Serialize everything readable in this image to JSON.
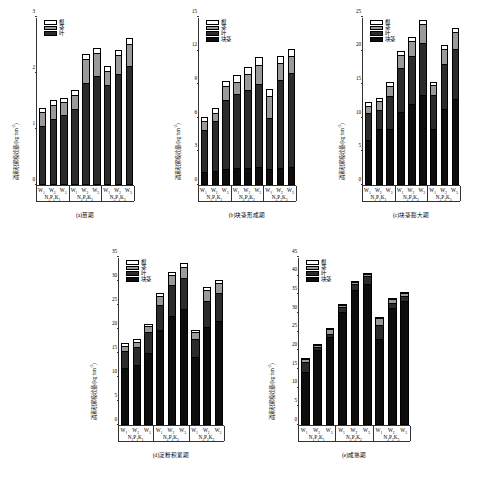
{
  "figure": {
    "width": 496,
    "height": 477,
    "background": "#ffffff",
    "ink": "#000000"
  },
  "series_fills": {
    "root": "#ffffff",
    "stem": "#9a9a9a",
    "leaf": "#2b2b2b",
    "tuber": "#0d0d0d"
  },
  "groups": [
    "N₁P₁K₁",
    "N₂P₂K₂",
    "N₃P₃K₃"
  ],
  "water_levels": [
    "W₁",
    "W₂",
    "W₃"
  ],
  "chart_data": [
    {
      "id": "a",
      "type": "bar",
      "subtype": "stacked",
      "title": "(a)苗期",
      "ylabel": "磷素积累吸收量/(kg·hm⁻²)",
      "xlabel": "",
      "ylim": [
        0,
        3
      ],
      "yticks": [
        0,
        1,
        2,
        3
      ],
      "grid": false,
      "legend_position": "top-left",
      "legend": [
        "根",
        "茎",
        "叶"
      ],
      "categories": [
        "W₁",
        "W₂",
        "W₃",
        "W₁",
        "W₂",
        "W₃",
        "W₁",
        "W₂",
        "W₃"
      ],
      "group_labels": [
        "N₁P₁K₁",
        "N₂P₂K₂",
        "N₃P₃K₃"
      ],
      "series": [
        {
          "name": "叶",
          "values": [
            1.06,
            1.18,
            1.25,
            1.35,
            1.83,
            1.95,
            1.78,
            1.99,
            2.13
          ]
        },
        {
          "name": "茎",
          "values": [
            0.24,
            0.25,
            0.23,
            0.25,
            0.42,
            0.4,
            0.25,
            0.34,
            0.39
          ]
        },
        {
          "name": "根",
          "values": [
            0.08,
            0.08,
            0.08,
            0.09,
            0.09,
            0.1,
            0.09,
            0.09,
            0.1
          ]
        }
      ],
      "totals": [
        1.38,
        1.51,
        1.56,
        1.69,
        2.34,
        2.45,
        2.12,
        2.42,
        2.62
      ]
    },
    {
      "id": "b",
      "type": "bar",
      "subtype": "stacked",
      "title": "(b)块茎形成期",
      "ylabel": "磷素积累吸收量/(kg·hm⁻²)",
      "xlabel": "",
      "ylim": [
        0,
        15
      ],
      "yticks": [
        0,
        3,
        6,
        9,
        12,
        15
      ],
      "grid": false,
      "legend_position": "top-left",
      "legend": [
        "根",
        "茎",
        "叶",
        "块茎"
      ],
      "categories": [
        "W₁",
        "W₂",
        "W₃",
        "W₁",
        "W₂",
        "W₃",
        "W₁",
        "W₂",
        "W₃"
      ],
      "group_labels": [
        "N₁P₁K₁",
        "N₂P₂K₂",
        "N₃P₃K₃"
      ],
      "series": [
        {
          "name": "块茎",
          "values": [
            1.2,
            1.25,
            1.45,
            1.5,
            1.55,
            1.6,
            1.45,
            1.55,
            1.65
          ]
        },
        {
          "name": "叶",
          "values": [
            3.75,
            4.45,
            6.1,
            6.6,
            6.9,
            7.4,
            4.55,
            7.85,
            8.35
          ]
        },
        {
          "name": "茎",
          "values": [
            0.75,
            0.75,
            1.3,
            1.1,
            1.45,
            1.7,
            1.95,
            1.5,
            1.5
          ]
        },
        {
          "name": "根",
          "values": [
            0.35,
            0.4,
            0.4,
            0.6,
            0.65,
            0.7,
            0.6,
            0.65,
            0.65
          ]
        }
      ],
      "totals": [
        6.05,
        6.85,
        9.25,
        9.8,
        10.55,
        11.4,
        8.55,
        11.55,
        12.15
      ]
    },
    {
      "id": "c",
      "type": "bar",
      "subtype": "stacked",
      "title": "(c)块茎膨大期",
      "ylabel": "磷素积累吸收量/(kg·hm⁻²)",
      "xlabel": "",
      "ylim": [
        0,
        25
      ],
      "yticks": [
        0,
        5,
        10,
        15,
        20,
        25
      ],
      "grid": false,
      "legend_position": "top-left",
      "legend": [
        "根",
        "茎",
        "叶",
        "块茎"
      ],
      "categories": [
        "W₁",
        "W₂",
        "W₃",
        "W₁",
        "W₂",
        "W₃",
        "W₁",
        "W₂",
        "W₃"
      ],
      "group_labels": [
        "N₁P₁K₁",
        "N₂P₂K₂",
        "N₃P₃K₃"
      ],
      "series": [
        {
          "name": "块茎",
          "values": [
            6.7,
            8.3,
            8.4,
            10.9,
            12.0,
            13.4,
            8.3,
            11.3,
            12.8
          ]
        },
        {
          "name": "叶",
          "values": [
            4.05,
            2.9,
            4.9,
            6.5,
            7.2,
            7.8,
            5.1,
            6.7,
            7.4
          ]
        },
        {
          "name": "茎",
          "values": [
            1.05,
            1.3,
            1.5,
            2.0,
            2.3,
            2.8,
            1.5,
            2.3,
            2.5
          ]
        },
        {
          "name": "根",
          "values": [
            0.5,
            0.5,
            0.5,
            0.6,
            0.6,
            0.6,
            0.5,
            0.6,
            0.6
          ]
        }
      ],
      "totals": [
        12.3,
        13.0,
        15.3,
        20.0,
        22.1,
        24.6,
        15.4,
        20.9,
        23.3
      ]
    },
    {
      "id": "d",
      "type": "bar",
      "subtype": "stacked",
      "title": "(d)淀粉积累期",
      "ylabel": "磷素积累吸收量/(kg·hm⁻²)",
      "xlabel": "",
      "ylim": [
        0,
        35
      ],
      "yticks": [
        0,
        5,
        10,
        15,
        20,
        25,
        30,
        35
      ],
      "grid": false,
      "legend_position": "top-left",
      "legend": [
        "根",
        "茎",
        "叶",
        "块茎"
      ],
      "categories": [
        "W₁",
        "W₂",
        "W₃",
        "W₁",
        "W₂",
        "W₃",
        "W₁",
        "W₂",
        "W₃"
      ],
      "group_labels": [
        "N₁P₁K₁",
        "N₂P₂K₂",
        "N₃P₃K₃"
      ],
      "series": [
        {
          "name": "块茎",
          "values": [
            11.9,
            12.5,
            15.1,
            19.7,
            22.7,
            24.1,
            14.1,
            20.4,
            21.6
          ]
        },
        {
          "name": "叶",
          "values": [
            3.5,
            3.7,
            4.3,
            5.3,
            6.5,
            6.5,
            3.9,
            5.4,
            5.9
          ]
        },
        {
          "name": "茎",
          "values": [
            1.1,
            1.2,
            1.2,
            1.9,
            2.1,
            2.4,
            1.4,
            2.3,
            2.1
          ]
        },
        {
          "name": "根",
          "values": [
            0.5,
            0.5,
            0.5,
            0.6,
            0.6,
            0.7,
            0.5,
            0.6,
            0.6
          ]
        }
      ],
      "totals": [
        17.0,
        17.9,
        21.1,
        27.5,
        31.9,
        33.7,
        19.9,
        28.7,
        30.2
      ]
    },
    {
      "id": "e",
      "type": "bar",
      "subtype": "stacked",
      "title": "(e)成熟期",
      "ylabel": "磷素积累吸收量/(kg·hm⁻²)",
      "xlabel": "",
      "ylim": [
        0,
        45
      ],
      "yticks": [
        0,
        5,
        10,
        15,
        20,
        25,
        30,
        35,
        40,
        45
      ],
      "grid": false,
      "legend_position": "top-left",
      "legend": [
        "根",
        "茎",
        "叶",
        "块茎"
      ],
      "categories": [
        "W₁",
        "W₂",
        "W₃",
        "W₁",
        "W₂",
        "W₃",
        "W₁",
        "W₂",
        "W₃"
      ],
      "group_labels": [
        "N₁P₁K₁",
        "N₂P₂K₂",
        "N₃P₃K₃"
      ],
      "series": [
        {
          "name": "块茎",
          "values": [
            14.3,
            20.1,
            23.7,
            30.4,
            36.1,
            37.9,
            23.1,
            31.4,
            33.3
          ]
        },
        {
          "name": "叶",
          "values": [
            2.5,
            0.8,
            0.8,
            1.2,
            1.6,
            1.9,
            3.8,
            1.2,
            1.2
          ]
        },
        {
          "name": "茎",
          "values": [
            0.8,
            0.5,
            1.2,
            0.6,
            0.6,
            0.7,
            1.8,
            1.1,
            0.9
          ]
        },
        {
          "name": "根",
          "values": [
            0.4,
            0.3,
            0.3,
            0.3,
            0.3,
            0.3,
            0.3,
            0.3,
            0.3
          ]
        }
      ],
      "totals": [
        18.0,
        21.7,
        26.0,
        32.5,
        38.6,
        40.8,
        29.0,
        34.0,
        35.7
      ]
    }
  ]
}
